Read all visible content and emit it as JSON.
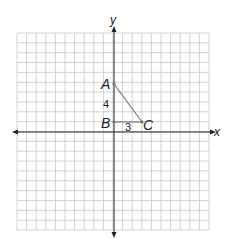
{
  "diagram": {
    "type": "coordinate-plane",
    "axes": {
      "x_label": "x",
      "y_label": "y"
    },
    "grid": {
      "columns": 20,
      "rows": 20,
      "color": "#c8c8c8"
    },
    "points": [
      {
        "name": "A",
        "x": 0,
        "y": 5
      },
      {
        "name": "B",
        "x": 0,
        "y": 1
      },
      {
        "name": "C",
        "x": 3,
        "y": 1
      }
    ],
    "segments": [
      {
        "from": "A",
        "to": "C"
      },
      {
        "from": "B",
        "to": "C"
      }
    ],
    "side_labels": {
      "AB": "4",
      "BC": "3"
    },
    "colors": {
      "axis": "#222222",
      "segment": "#777777",
      "grid": "#c8c8c8"
    }
  }
}
